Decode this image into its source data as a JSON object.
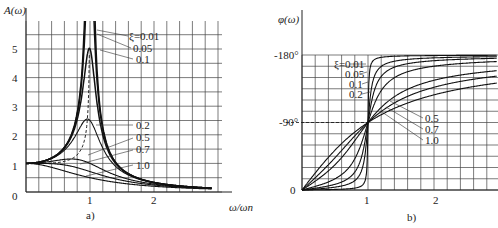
{
  "chart_data": [
    {
      "type": "line",
      "title": "",
      "caption": "a)",
      "xlabel": "ω/ωn",
      "ylabel": "A(ω)",
      "xlim": [
        0,
        2.9
      ],
      "ylim": [
        0,
        5.9
      ],
      "xticks": [
        "0",
        "1",
        "2"
      ],
      "yticks": [
        "0",
        "1",
        "2",
        "3",
        "4",
        "5"
      ],
      "grid": true,
      "legend_position": "inline-right",
      "series_param": "ξ",
      "series": [
        {
          "name": "ξ=0.01",
          "zeta": 0.01,
          "peak": 50.0
        },
        {
          "name": "0.05",
          "zeta": 0.05,
          "peak": 10.0
        },
        {
          "name": "0.1",
          "zeta": 0.1,
          "peak": 5.0
        },
        {
          "name": "0.2",
          "zeta": 0.2,
          "peak": 2.55
        },
        {
          "name": "0.5",
          "zeta": 0.5,
          "peak": 1.15
        },
        {
          "name": "0.7",
          "zeta": 0.7,
          "peak": 1.0
        },
        {
          "name": "1.0",
          "zeta": 1.0,
          "peak": 1.0
        }
      ],
      "annotations": [
        "dashed line: resonance peak locus"
      ]
    },
    {
      "type": "line",
      "title": "",
      "caption": "b)",
      "xlabel": "",
      "ylabel": "φ(ω)",
      "xlim": [
        0,
        2.9
      ],
      "ylim": [
        0,
        -180
      ],
      "xticks": [
        "1",
        "2"
      ],
      "yticks": [
        "0",
        "-90°",
        "-180°"
      ],
      "grid": true,
      "legend_position": "inline",
      "series_param": "ξ",
      "series": [
        {
          "name": "ξ=0.01",
          "zeta": 0.01
        },
        {
          "name": "0.05",
          "zeta": 0.05
        },
        {
          "name": "0.1",
          "zeta": 0.1
        },
        {
          "name": "0.2",
          "zeta": 0.2
        },
        {
          "name": "0.5",
          "zeta": 0.5
        },
        {
          "name": "0.7",
          "zeta": 0.7
        },
        {
          "name": "1.0",
          "zeta": 1.0
        }
      ],
      "annotations": [
        "dashed line at -90°, all curves cross at ω/ωn = 1"
      ]
    }
  ],
  "left": {
    "ylabel": "A(ω)",
    "xlabel": "ω/ωn",
    "caption": "a)",
    "yticks": [
      "0",
      "1",
      "2",
      "3",
      "4",
      "5"
    ],
    "xticks": [
      "1",
      "2"
    ],
    "legend": [
      "ξ=0.01",
      "0.05",
      "0.1",
      "0.2",
      "0.5",
      "0.7",
      "1.0"
    ]
  },
  "right": {
    "ylabel": "φ(ω)",
    "caption": "b)",
    "yticks": [
      "0",
      "-90°",
      "-180°"
    ],
    "xticks": [
      "1",
      "2"
    ],
    "legend_top": [
      "ξ=0.01",
      "0.05",
      "0.1",
      "0.2"
    ],
    "legend_bottom": [
      "0.5",
      "0.7",
      "1.0"
    ]
  },
  "zetas": [
    0.01,
    0.05,
    0.1,
    0.2,
    0.5,
    0.7,
    1.0
  ]
}
